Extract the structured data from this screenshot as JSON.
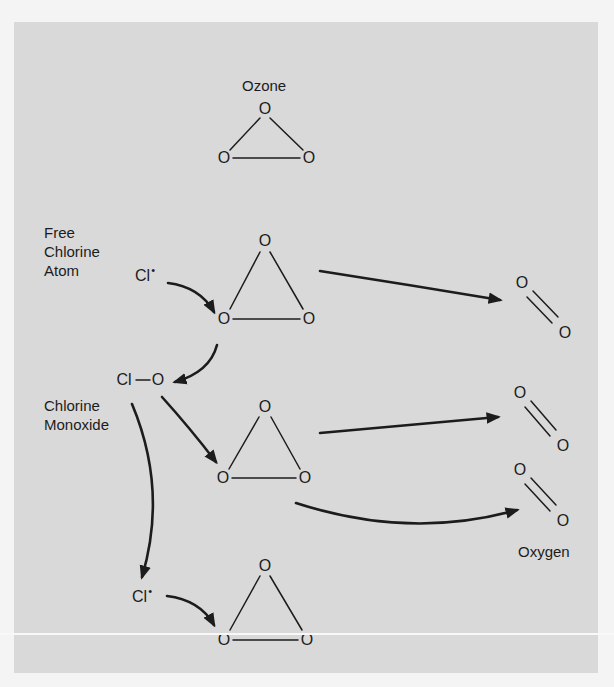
{
  "title": "Ozone",
  "colors": {
    "panel_background": "#d9d9d9",
    "page_background": "#f4f4f4",
    "ink": "#1c1c1c"
  },
  "labels": {
    "ozone": "Ozone",
    "free_chlorine_atom": [
      "Free",
      "Chlorine",
      "Atom"
    ],
    "chlorine_monoxide": [
      "Chlorine",
      "Monoxide"
    ],
    "oxygen": "Oxygen"
  },
  "atoms": {
    "oxygen_symbol": "O",
    "chlorine_symbol": "Cl",
    "radical_dot": "•",
    "chlorine_monoxide_formula": [
      "Cl",
      "—",
      "O"
    ]
  },
  "molecules": [
    {
      "id": "ozone-reference",
      "type": "O3",
      "top": [
        265,
        109
      ],
      "left": [
        224,
        158
      ],
      "right": [
        309,
        158
      ]
    },
    {
      "id": "ozone-1",
      "type": "O3",
      "top": [
        265,
        241
      ],
      "left": [
        224,
        319
      ],
      "right": [
        309,
        319
      ]
    },
    {
      "id": "ozone-2",
      "type": "O3",
      "top": [
        265,
        407
      ],
      "left": [
        223,
        478
      ],
      "right": [
        305,
        478
      ]
    },
    {
      "id": "ozone-3",
      "type": "O3",
      "top": [
        265,
        566
      ],
      "left": [
        224,
        640
      ],
      "right": [
        307,
        640
      ]
    },
    {
      "id": "oxygen-1",
      "type": "O2",
      "top": [
        522,
        283
      ],
      "bottom": [
        565,
        333
      ]
    },
    {
      "id": "oxygen-2",
      "type": "O2",
      "top": [
        520,
        393
      ],
      "bottom": [
        563,
        446
      ]
    },
    {
      "id": "oxygen-3",
      "type": "O2",
      "top": [
        520,
        470
      ],
      "bottom": [
        563,
        521
      ]
    }
  ],
  "reaction_steps": [
    "Cl• + O3 → ClO + O2",
    "ClO + O3 → Cl• + 2 O2"
  ]
}
